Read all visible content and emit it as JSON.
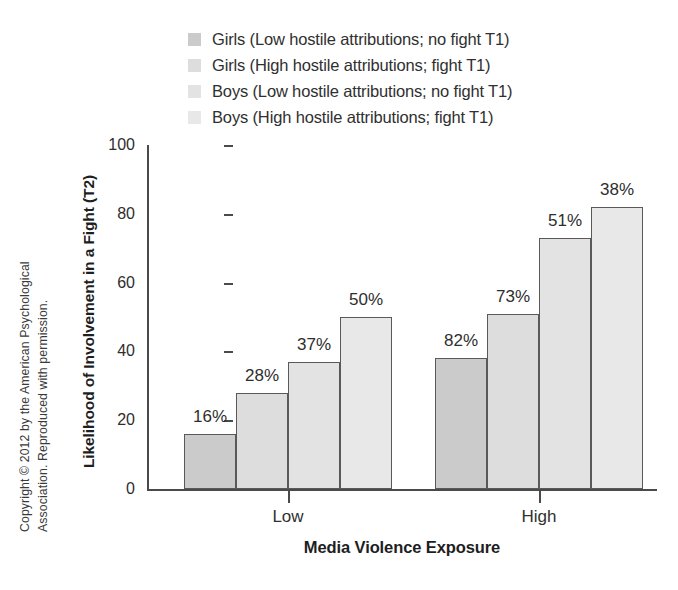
{
  "copyright": {
    "line1": "Copyright © 2012 by the American Psychological",
    "line2": "Association. Reproduced with permission."
  },
  "chart_data": {
    "type": "bar",
    "title": "",
    "xlabel": "Media Violence Exposure",
    "ylabel": "Likelihood of Involvement in a Fight (T2)",
    "categories": [
      "Low",
      "High"
    ],
    "ylim": [
      0,
      100
    ],
    "yticks": [
      0,
      20,
      40,
      60,
      80,
      100
    ],
    "ytick_labels": [
      "0",
      "20",
      "40",
      "60",
      "80",
      "100"
    ],
    "grid": false,
    "legend_position": "top",
    "series": [
      {
        "name": "Girls (Low hostile attributions; no fight T1)",
        "color": "#cbcbcb",
        "values": [
          16,
          38
        ],
        "labels": [
          "16%",
          "82%"
        ]
      },
      {
        "name": "Girls (High hostile attributions; fight T1)",
        "color": "#dddddd",
        "values": [
          28,
          51
        ],
        "labels": [
          "28%",
          "73%"
        ]
      },
      {
        "name": "Boys (Low hostile attributions; no fight T1)",
        "color": "#e3e3e3",
        "values": [
          37,
          73
        ],
        "labels": [
          "37%",
          "51%"
        ]
      },
      {
        "name": "Boys (High hostile attributions; fight T1)",
        "color": "#e8e8e8",
        "values": [
          50,
          82
        ],
        "labels": [
          "50%",
          "38%"
        ]
      }
    ]
  }
}
